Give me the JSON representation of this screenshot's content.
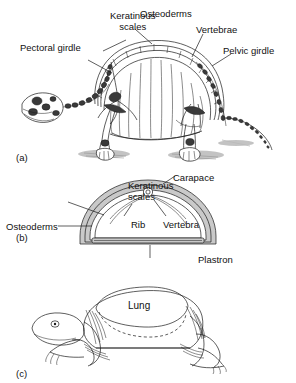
{
  "figure": {
    "background": "#ffffff",
    "ink": "#1a1a1a",
    "shell_fill": "#c9c9c9"
  },
  "panels": [
    {
      "id": "a",
      "letter": "(a)",
      "caption": "Lateral view of turtle skeleton within shell",
      "labels": [
        {
          "name": "pectoral-girdle",
          "text": "Pectoral girdle"
        },
        {
          "name": "keratinous-scales",
          "text": "Keratinous\nscales"
        },
        {
          "name": "osteoderms",
          "text": "Osteoderms"
        },
        {
          "name": "vertebrae",
          "text": "Vertebrae"
        },
        {
          "name": "pelvic-girdle",
          "text": "Pelvic girdle"
        }
      ]
    },
    {
      "id": "b",
      "letter": "(b)",
      "caption": "Transverse cross-section of the shell",
      "labels": [
        {
          "name": "carapace",
          "text": "Carapace"
        },
        {
          "name": "keratinous-scales",
          "text": "Keratinous\nscales"
        },
        {
          "name": "osteoderms",
          "text": "Osteoderms"
        },
        {
          "name": "rib",
          "text": "Rib"
        },
        {
          "name": "vertebra",
          "text": "Vertebra"
        },
        {
          "name": "plastron",
          "text": "Plastron"
        }
      ]
    },
    {
      "id": "c",
      "letter": "(c)",
      "caption": "Anterior view showing lung cavity",
      "labels": [
        {
          "name": "lung",
          "text": "Lung"
        }
      ]
    }
  ],
  "panel_a": {
    "letter": "(a)",
    "pectoral_girdle": "Pectoral girdle",
    "keratinous_scales": "Keratinous\nscales",
    "osteoderms": "Osteoderms",
    "vertebrae": "Vertebrae",
    "pelvic_girdle": "Pelvic girdle"
  },
  "panel_b": {
    "letter": "(b)",
    "carapace": "Carapace",
    "keratinous_scales": "Keratinous\nscales",
    "osteoderms": "Osteoderms",
    "rib": "Rib",
    "vertebra": "Vertebra",
    "plastron": "Plastron"
  },
  "panel_c": {
    "letter": "(c)",
    "lung": "Lung"
  }
}
